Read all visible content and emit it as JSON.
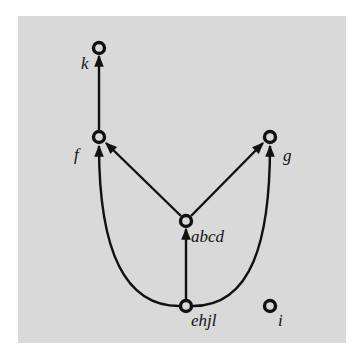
{
  "diagram": {
    "type": "directed-graph",
    "background_color": "#d9d9d9",
    "edge_color": "#111111",
    "nodes": [
      {
        "id": "k",
        "label": "k",
        "x": 99,
        "y": 48
      },
      {
        "id": "f",
        "label": "f",
        "x": 99,
        "y": 137
      },
      {
        "id": "g",
        "label": "g",
        "x": 270,
        "y": 137
      },
      {
        "id": "abcd",
        "label": "abcd",
        "x": 186,
        "y": 221
      },
      {
        "id": "ehjl",
        "label": "ehjl",
        "x": 186,
        "y": 306
      },
      {
        "id": "i",
        "label": "i",
        "x": 270,
        "y": 306
      }
    ],
    "edges": [
      {
        "from": "f",
        "to": "k"
      },
      {
        "from": "abcd",
        "to": "f"
      },
      {
        "from": "abcd",
        "to": "g"
      },
      {
        "from": "ehjl",
        "to": "abcd"
      },
      {
        "from": "ehjl",
        "to": "f",
        "curved": true
      },
      {
        "from": "ehjl",
        "to": "g",
        "curved": true
      }
    ]
  }
}
